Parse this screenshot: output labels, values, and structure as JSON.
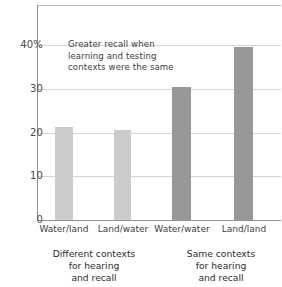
{
  "chart_data": {
    "type": "bar",
    "title": "",
    "subtitle": "",
    "xlabel": "",
    "ylabel": "",
    "categories": [
      "Water/land",
      "Land/water",
      "Water/water",
      "Land/land"
    ],
    "values": [
      21.3,
      20.5,
      30.5,
      39.5
    ],
    "series": [
      {
        "name": "Percent recall",
        "values": [
          21.3,
          20.5,
          30.5,
          39.5
        ]
      }
    ],
    "bar_colors": [
      "#cccccc",
      "#cccccc",
      "#989898",
      "#989898"
    ],
    "ylim": [
      0,
      44
    ],
    "yticks": [
      0,
      10,
      20,
      30,
      40
    ],
    "ytick_labels": [
      "0",
      "10",
      "20",
      "30",
      "40%"
    ],
    "grid": true,
    "grid_axis": "y",
    "legend": "none",
    "annotations": [
      {
        "text_lines": [
          "Greater recall when",
          "learning and testing",
          "contexts were the same"
        ]
      }
    ],
    "groups": [
      {
        "label_lines": [
          "Different contexts",
          "for hearing",
          "and recall"
        ],
        "categories": [
          "Water/land",
          "Land/water"
        ]
      },
      {
        "label_lines": [
          "Same contexts",
          "for hearing",
          "and recall"
        ],
        "categories": [
          "Water/water",
          "Land/land"
        ]
      }
    ],
    "colors": {
      "axis": "#8f8f8f",
      "grid": "#d4d4d4",
      "text": "#3d3d3d",
      "bar_light": "#cccccc",
      "bar_dark": "#989898"
    }
  }
}
